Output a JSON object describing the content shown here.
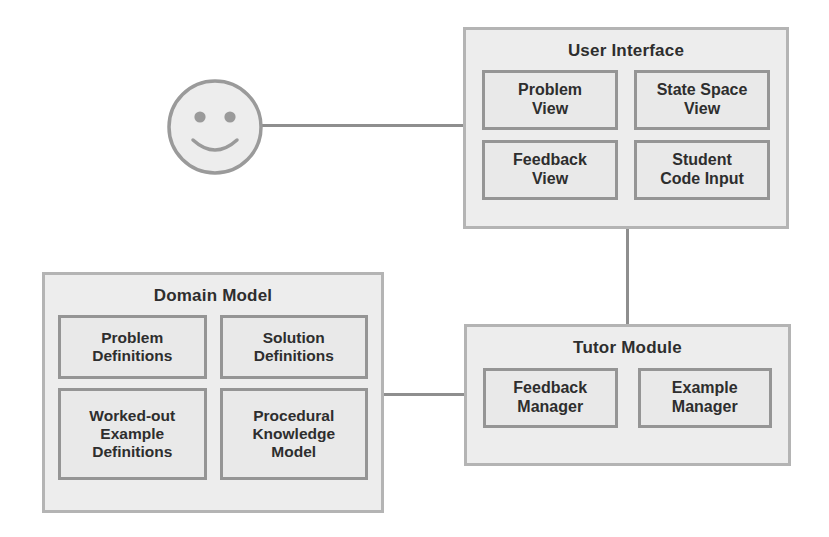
{
  "diagram": {
    "colors": {
      "module_fill": "#ededed",
      "module_border": "#b4b4b4",
      "component_fill": "#e9e9e9",
      "component_border": "#959595",
      "connector": "#8e8e8e",
      "text": "#2e2e2e",
      "actor_fill": "#ededed",
      "actor_stroke": "#9a9a9a"
    },
    "actor": {
      "name": "smiley-face-user",
      "icon": "smiley-face-icon"
    },
    "modules": [
      {
        "id": "user-interface",
        "title": "User Interface",
        "components": [
          {
            "id": "problem-view",
            "label": "Problem\nView"
          },
          {
            "id": "state-space-view",
            "label": "State Space\nView"
          },
          {
            "id": "feedback-view",
            "label": "Feedback\nView"
          },
          {
            "id": "student-code-input",
            "label": "Student\nCode Input"
          }
        ]
      },
      {
        "id": "tutor-module",
        "title": "Tutor Module",
        "components": [
          {
            "id": "feedback-manager",
            "label": "Feedback\nManager"
          },
          {
            "id": "example-manager",
            "label": "Example\nManager"
          }
        ]
      },
      {
        "id": "domain-model",
        "title": "Domain Model",
        "components": [
          {
            "id": "problem-definitions",
            "label": "Problem\nDefinitions"
          },
          {
            "id": "solution-definitions",
            "label": "Solution\nDefinitions"
          },
          {
            "id": "worked-out-example-definitions",
            "label": "Worked-out\nExample\nDefinitions"
          },
          {
            "id": "procedural-knowledge-model",
            "label": "Procedural\nKnowledge\nModel"
          }
        ]
      }
    ],
    "connections": [
      {
        "id": "user-to-user-interface",
        "from": "smiley-face-user",
        "to": "user-interface",
        "orientation": "horizontal"
      },
      {
        "id": "user-interface-to-tutor-module",
        "from": "user-interface",
        "to": "tutor-module",
        "orientation": "vertical"
      },
      {
        "id": "domain-model-to-tutor-module",
        "from": "domain-model",
        "to": "tutor-module",
        "orientation": "horizontal"
      }
    ]
  }
}
